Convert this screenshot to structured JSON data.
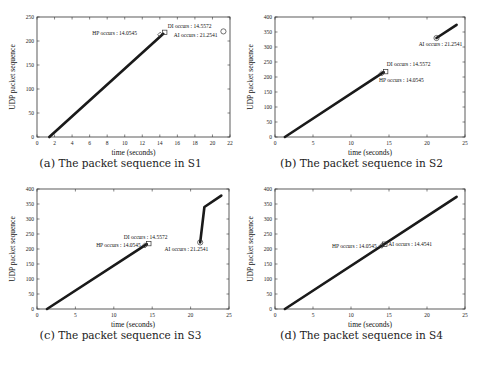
{
  "figure": {
    "panels": [
      {
        "id": "a",
        "tag": "(a)",
        "caption": "The packet sequence in S1"
      },
      {
        "id": "b",
        "tag": "(b)",
        "caption": "The packet sequence in S2"
      },
      {
        "id": "c",
        "tag": "(c)",
        "caption": "The packet sequence in S3"
      },
      {
        "id": "d",
        "tag": "(d)",
        "caption": "The packet sequence in S4"
      }
    ]
  },
  "chart_data": [
    {
      "type": "line",
      "title": "The packet sequence in S1",
      "xlabel": "time (seconds)",
      "ylabel": "UDP packet sequence",
      "xlim": [
        0,
        22
      ],
      "ylim": [
        0,
        250
      ],
      "xticks": [
        0,
        2,
        4,
        6,
        8,
        10,
        12,
        14,
        16,
        18,
        20,
        22
      ],
      "yticks": [
        0,
        50,
        100,
        150,
        200,
        250
      ],
      "grid": false,
      "series": [
        {
          "name": "packets",
          "x": [
            1.4,
            14.4
          ],
          "y": [
            0,
            215
          ]
        }
      ],
      "markers": [
        {
          "shape": "diamond",
          "x": 14.05,
          "y": 213
        },
        {
          "shape": "square",
          "x": 14.56,
          "y": 218
        },
        {
          "shape": "circle",
          "x": 21.25,
          "y": 220
        }
      ],
      "annotations": [
        {
          "text": "DI occurs : 14.5572",
          "x": 14.9,
          "y": 227,
          "anchor": "start"
        },
        {
          "text": "HP occurs : 14.0545",
          "x": 6.3,
          "y": 213,
          "anchor": "start"
        },
        {
          "text": "AI occurs : 21.2541",
          "x": 15.6,
          "y": 208,
          "anchor": "start"
        }
      ]
    },
    {
      "type": "line",
      "title": "The packet sequence in S2",
      "xlabel": "time (seconds)",
      "ylabel": "UDP packet sequence",
      "xlim": [
        0,
        25
      ],
      "ylim": [
        0,
        400
      ],
      "xticks": [
        0,
        5,
        10,
        15,
        20,
        25
      ],
      "yticks": [
        0,
        50,
        100,
        150,
        200,
        250,
        300,
        350,
        400
      ],
      "grid": false,
      "series": [
        {
          "name": "packets-1",
          "x": [
            1.3,
            14.3
          ],
          "y": [
            0,
            216
          ]
        },
        {
          "name": "packets-2",
          "x": [
            21.25,
            23.9
          ],
          "y": [
            330,
            374
          ]
        }
      ],
      "markers": [
        {
          "shape": "diamond",
          "x": 14.05,
          "y": 212
        },
        {
          "shape": "square",
          "x": 14.56,
          "y": 218
        },
        {
          "shape": "circle",
          "x": 21.25,
          "y": 330
        }
      ],
      "annotations": [
        {
          "text": "DI occurs : 14.5572",
          "x": 14.7,
          "y": 236,
          "anchor": "start"
        },
        {
          "text": "HP occurs : 14.0545",
          "x": 13.7,
          "y": 183,
          "anchor": "start"
        },
        {
          "text": "AI occurs : 21.2541",
          "x": 18.9,
          "y": 305,
          "anchor": "start"
        }
      ]
    },
    {
      "type": "line",
      "title": "The packet sequence in S3",
      "xlabel": "time (seconds)",
      "ylabel": "UDP packet sequence",
      "xlim": [
        0,
        25
      ],
      "ylim": [
        0,
        400
      ],
      "xticks": [
        0,
        5,
        10,
        15,
        20,
        25
      ],
      "yticks": [
        0,
        50,
        100,
        150,
        200,
        250,
        300,
        350,
        400
      ],
      "grid": false,
      "series": [
        {
          "name": "packets-1",
          "x": [
            1.3,
            14.3
          ],
          "y": [
            0,
            216
          ]
        },
        {
          "name": "packets-2",
          "x": [
            21.25,
            21.8,
            24.0
          ],
          "y": [
            222,
            340,
            378
          ]
        }
      ],
      "markers": [
        {
          "shape": "diamond",
          "x": 14.05,
          "y": 212
        },
        {
          "shape": "square",
          "x": 14.56,
          "y": 218
        },
        {
          "shape": "circle",
          "x": 21.25,
          "y": 222
        }
      ],
      "annotations": [
        {
          "text": "DI occurs : 14.5572",
          "x": 11.3,
          "y": 233,
          "anchor": "start"
        },
        {
          "text": "HP occurs : 14.0545",
          "x": 7.7,
          "y": 207,
          "anchor": "start"
        },
        {
          "text": "AI occurs : 21.2541",
          "x": 16.6,
          "y": 193,
          "anchor": "start"
        }
      ]
    },
    {
      "type": "line",
      "title": "The packet sequence in S4",
      "xlabel": "time (seconds)",
      "ylabel": "UDP packet sequence",
      "xlim": [
        0,
        25
      ],
      "ylim": [
        0,
        400
      ],
      "xticks": [
        0,
        5,
        10,
        15,
        20,
        25
      ],
      "yticks": [
        0,
        50,
        100,
        150,
        200,
        250,
        300,
        350,
        400
      ],
      "grid": false,
      "series": [
        {
          "name": "packets",
          "x": [
            1.3,
            23.9
          ],
          "y": [
            0,
            374
          ]
        }
      ],
      "markers": [
        {
          "shape": "diamond",
          "x": 14.05,
          "y": 211
        },
        {
          "shape": "square",
          "x": 14.45,
          "y": 216
        }
      ],
      "annotations": [
        {
          "text": "HP occurs : 14.0545",
          "x": 7.5,
          "y": 205,
          "anchor": "start"
        },
        {
          "text": "AI occurs : 14.4541",
          "x": 14.9,
          "y": 210,
          "anchor": "start"
        }
      ]
    }
  ]
}
